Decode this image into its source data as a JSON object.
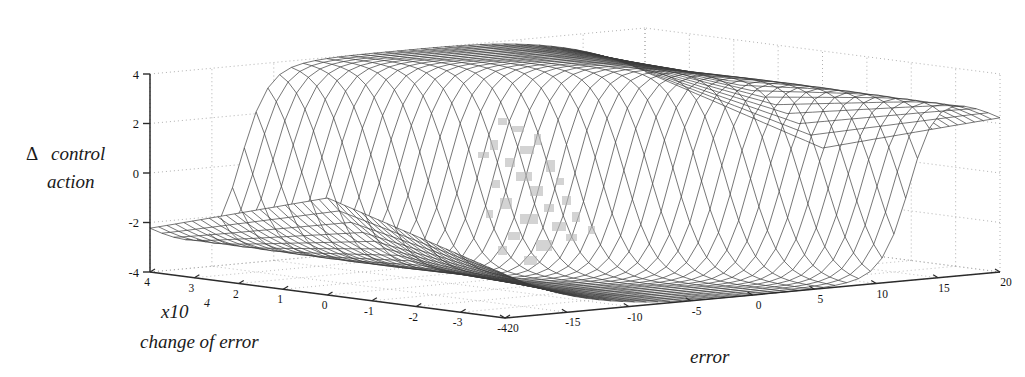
{
  "figure": {
    "type": "3d-surface-mesh-plot",
    "background_color": "#ffffff",
    "mesh_color": "#3a3a3a",
    "axis_color": "#2b2b2b",
    "grid_color": "#9a9a9a",
    "scan_artifact_color": "#b8b8b8"
  },
  "labels": {
    "z_axis_line1_delta": "Δ",
    "z_axis_line1_word": "control",
    "z_axis_line2": "action",
    "y_axis_scale_base": "x10",
    "y_axis_scale_exp": "4",
    "y_axis_name": "change  of  error",
    "x_axis_name": "error"
  },
  "axes": {
    "z": {
      "name": "Δ control action",
      "ticks": [
        4,
        2,
        0,
        -2,
        -4
      ],
      "tick_labels": [
        "4",
        "2",
        "0",
        "-2",
        "-4"
      ],
      "range": [
        -4,
        4
      ]
    },
    "y": {
      "name": "change of error",
      "scale": "x10^4",
      "ticks": [
        4,
        3,
        2,
        1,
        0,
        -1,
        -2,
        -3,
        -4
      ],
      "tick_labels": [
        "4",
        "3",
        "2",
        "1",
        "0",
        "-1",
        "-2",
        "-3",
        "-4"
      ],
      "range": [
        -4,
        4
      ]
    },
    "x": {
      "name": "error",
      "ticks": [
        -20,
        -15,
        -10,
        -5,
        0,
        5,
        10,
        15,
        20
      ],
      "tick_labels": [
        "-20",
        "-15",
        "-10",
        "-5",
        "0",
        "5",
        "10",
        "15",
        "20"
      ],
      "range": [
        -20,
        20
      ]
    }
  },
  "chart_data": {
    "type": "surface",
    "title": "",
    "xlabel": "error",
    "ylabel": "change of error",
    "zlabel": "Δ control action",
    "xlim": [
      -20,
      20
    ],
    "ylim": [
      -4,
      4
    ],
    "zlim": [
      -4,
      4
    ],
    "y_scale_factor": 10000,
    "grid": true,
    "legend": null,
    "surface_model": {
      "kind": "bi-sigmoid-saturation",
      "formula_note": "z = 4 * tanh(a*(x/20) + b*(y/4)) shaped with flattened corner relaxation",
      "x_steps": 42,
      "y_steps": 42,
      "plateau_high": 4,
      "plateau_low": -4,
      "transition_half_width_x": 4,
      "corner_relax_to": 0
    },
    "samples": {
      "x": [
        -20,
        -15,
        -10,
        -5,
        -2,
        0,
        2,
        5,
        10,
        15,
        20
      ],
      "y": [
        -4,
        -2,
        0,
        2,
        4
      ],
      "z": [
        [
          0.0,
          -0.3,
          -1.6,
          -3.6,
          -4.0,
          -4.0,
          -4.0,
          -4.0,
          -4.0,
          -3.0,
          -0.2
        ],
        [
          0.0,
          -0.4,
          -2.2,
          -3.9,
          -4.0,
          -4.0,
          -3.9,
          -2.0,
          1.0,
          1.2,
          0.1
        ],
        [
          0.0,
          -0.5,
          -2.6,
          -3.9,
          -3.0,
          0.0,
          3.0,
          3.9,
          2.6,
          0.5,
          0.0
        ],
        [
          -0.1,
          -1.2,
          -1.0,
          2.0,
          3.9,
          4.0,
          4.0,
          4.0,
          2.2,
          0.4,
          0.0
        ],
        [
          0.2,
          3.0,
          4.0,
          4.0,
          4.0,
          4.0,
          4.0,
          3.6,
          1.6,
          0.3,
          0.0
        ]
      ]
    }
  }
}
